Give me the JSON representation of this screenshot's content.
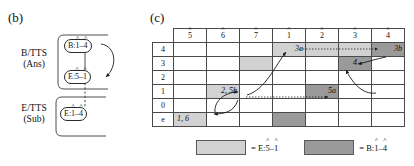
{
  "figure": {
    "panel_b": {
      "label": "(b)",
      "tiers": [
        {
          "name": "b-tts",
          "line1": "B/TTS",
          "line2": "(Ans)"
        },
        {
          "name": "e-tts",
          "line1": "E/TTS",
          "line2": "(Sub)"
        }
      ],
      "nodes": [
        {
          "id": "b-1-4",
          "prefix": "B:",
          "first": "1",
          "dash": "–",
          "second": "4"
        },
        {
          "id": "e-5-1",
          "prefix": "E:",
          "first": "5",
          "dash": "–",
          "second": "1"
        },
        {
          "id": "e-1-4",
          "prefix": "E:",
          "first": "1",
          "dash": "–",
          "second": "4"
        }
      ]
    },
    "panel_c": {
      "label": "(c)",
      "col_headers": [
        "5",
        "6",
        "7",
        "1",
        "2",
        "3",
        "4"
      ],
      "row_headers": [
        "4",
        "3",
        "2",
        "1",
        "0",
        "e"
      ],
      "cells": [
        {
          "row": "4",
          "col": "1",
          "shade": "light",
          "note": "3a",
          "align": "right"
        },
        {
          "row": "4",
          "col": "2",
          "shade": "light",
          "note": "",
          "align": "center"
        },
        {
          "row": "4",
          "col": "3",
          "shade": "light",
          "note": "",
          "align": "center"
        },
        {
          "row": "4",
          "col": "4",
          "shade": "dark",
          "note": "3b",
          "align": "right"
        },
        {
          "row": "3",
          "col": "7",
          "shade": "light",
          "note": "",
          "align": "center"
        },
        {
          "row": "3",
          "col": "3",
          "shade": "dark",
          "note": "4",
          "align": "center"
        },
        {
          "row": "1",
          "col": "6",
          "shade": "light",
          "note": "2, 5b",
          "align": "right"
        },
        {
          "row": "1",
          "col": "2",
          "shade": "dark",
          "note": "5a",
          "align": "right"
        },
        {
          "row": "e",
          "col": "5",
          "shade": "light",
          "note": "1, 6",
          "align": "left"
        },
        {
          "row": "e",
          "col": "1",
          "shade": "dark",
          "note": "",
          "align": "center"
        }
      ],
      "legend": [
        {
          "name": "e-5-1",
          "swatch": "light",
          "equals": "=",
          "prefix": "E:",
          "first": "5",
          "dash": "–",
          "second": "1"
        },
        {
          "name": "b-1-4",
          "swatch": "dark",
          "equals": "=",
          "prefix": "B:",
          "first": "1",
          "dash": "–",
          "second": "4"
        }
      ]
    }
  },
  "colors": {
    "shade_light": "#d2d2d2",
    "shade_dark": "#9a9a9a",
    "line": "#4a4a4a",
    "text": "#111111"
  }
}
